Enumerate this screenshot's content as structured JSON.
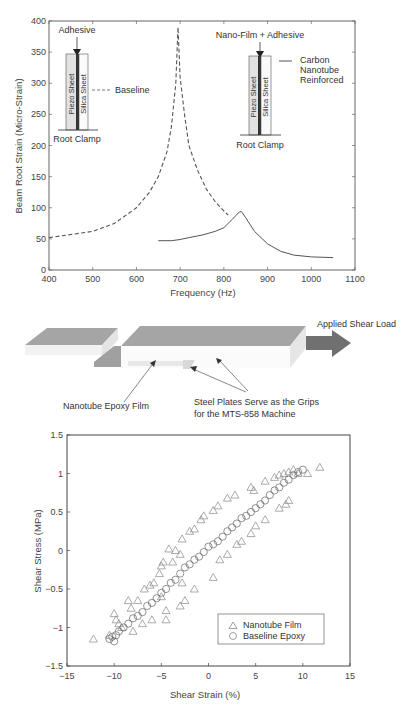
{
  "chart_data": [
    {
      "type": "line",
      "title": "",
      "xlabel": "Frequency (Hz)",
      "ylabel": "Beam Root Strain (Micro-Strain)",
      "xlim": [
        400,
        1100
      ],
      "ylim": [
        0,
        400
      ],
      "xticks": [
        400,
        500,
        600,
        700,
        800,
        900,
        1000,
        1100
      ],
      "yticks": [
        0,
        50,
        100,
        150,
        200,
        250,
        300,
        350,
        400
      ],
      "grid": false,
      "series": [
        {
          "name": "Baseline",
          "style": "dashed",
          "x": [
            400,
            450,
            500,
            550,
            600,
            630,
            650,
            670,
            680,
            690,
            695,
            700,
            710,
            720,
            740,
            760,
            780,
            800,
            810
          ],
          "y": [
            52,
            57,
            62,
            75,
            100,
            125,
            150,
            190,
            230,
            300,
            390,
            310,
            250,
            200,
            160,
            130,
            110,
            95,
            88
          ]
        },
        {
          "name": "Carbon Nanotube Reinforced",
          "style": "solid",
          "x": [
            650,
            680,
            700,
            720,
            750,
            780,
            800,
            820,
            835,
            840,
            850,
            870,
            900,
            930,
            960,
            1000,
            1050
          ],
          "y": [
            47,
            47,
            49,
            52,
            56,
            62,
            68,
            82,
            93,
            94,
            84,
            62,
            42,
            30,
            24,
            21,
            20
          ]
        }
      ],
      "annotations": [
        {
          "text": "Adhesive",
          "x": 460,
          "y": 385
        },
        {
          "text": "Baseline",
          "x": 560,
          "y": 300
        },
        {
          "text": "Root Clamp",
          "x": 460,
          "y": 215
        },
        {
          "text": "Nano-Film + Adhesive",
          "x": 880,
          "y": 380
        },
        {
          "text": "Carbon",
          "x": 930,
          "y": 340
        },
        {
          "text": "Nanotube",
          "x": 930,
          "y": 322
        },
        {
          "text": "Reinforced",
          "x": 930,
          "y": 305
        },
        {
          "text": "Root Clamp",
          "x": 880,
          "y": 200
        }
      ],
      "inset_labels": {
        "piezo": "Piezo Sheet",
        "silica": "Silica Sheet"
      }
    },
    {
      "type": "scatter",
      "title": "",
      "xlabel": "Shear Strain (%)",
      "ylabel": "Shear Stress (MPa)",
      "xlim": [
        -15,
        15
      ],
      "ylim": [
        -1.5,
        1.5
      ],
      "xticks": [
        -15,
        -10,
        -5,
        0,
        5,
        10,
        15
      ],
      "ytick_labels": [
        "1.5",
        "1",
        "0.5",
        "0",
        "−0.5",
        "−1",
        "−1.5"
      ],
      "xtick_labels": [
        "−15",
        "−10",
        "−5",
        "0",
        "5",
        "10",
        "15"
      ],
      "yticks": [
        1.5,
        1,
        0.5,
        0,
        -0.5,
        -1,
        -1.5
      ],
      "grid": false,
      "legend_position": "lower right",
      "series": [
        {
          "name": "Nanotube Film",
          "marker": "triangle",
          "x": [
            -12.2,
            -10.5,
            -10,
            -9.8,
            -9.2,
            -8.5,
            -8.2,
            -7.5,
            -6.8,
            -6.2,
            -5.8,
            -5.2,
            -5,
            -4.8,
            -4.2,
            -3.8,
            -3.5,
            -3,
            -2.8,
            -2,
            -1.5,
            -0.8,
            -0.5,
            0.5,
            1,
            2,
            2.8,
            4.5,
            4.8,
            6,
            7,
            7.5,
            8,
            8.5,
            9,
            9.5,
            10.5,
            11.8,
            -4.5,
            -3,
            -2.5,
            -1.5,
            0.5,
            1.2,
            2,
            3,
            3.5,
            4.5,
            5,
            6,
            7.5,
            8.2,
            8.5,
            -9.5,
            -8,
            -7,
            -6,
            -5,
            -4.5,
            -2.8
          ],
          "y": [
            -1.15,
            -1.1,
            -0.82,
            -0.9,
            -1.0,
            -0.65,
            -0.75,
            -0.65,
            -0.5,
            -0.45,
            -0.42,
            -0.3,
            -0.2,
            -0.15,
            0.02,
            -0.15,
            0.0,
            -0.05,
            0.15,
            0.25,
            0.28,
            0.4,
            0.45,
            0.52,
            0.58,
            0.68,
            0.72,
            0.82,
            0.78,
            0.9,
            0.95,
            0.98,
            1.0,
            1.02,
            1.05,
            1.0,
            1.0,
            1.08,
            -0.9,
            -0.72,
            -0.65,
            -0.5,
            -0.35,
            -0.12,
            -0.05,
            0.08,
            0.12,
            0.22,
            0.32,
            0.4,
            0.55,
            0.6,
            0.65,
            -0.95,
            -1.05,
            -0.95,
            -0.9,
            -0.6,
            -0.78,
            -0.42
          ]
        },
        {
          "name": "Baseline Epoxy",
          "marker": "circle",
          "x": [
            -10.5,
            -10.2,
            -10,
            -9.8,
            -9.5,
            -9,
            -8.5,
            -8,
            -7.5,
            -7,
            -6.5,
            -6,
            -5.5,
            -5,
            -4.5,
            -4,
            -3.5,
            -3,
            -2.5,
            -2,
            -1.5,
            -1,
            -0.5,
            0,
            0.5,
            1,
            1.5,
            2,
            2.5,
            3,
            3.5,
            4,
            4.5,
            5,
            5.5,
            6,
            6.5,
            7,
            7.5,
            8,
            8.5,
            9,
            9.5,
            10
          ],
          "y": [
            -1.15,
            -1.12,
            -1.18,
            -1.1,
            -1.05,
            -1.0,
            -0.95,
            -0.88,
            -0.85,
            -0.8,
            -0.72,
            -0.68,
            -0.62,
            -0.55,
            -0.5,
            -0.42,
            -0.38,
            -0.3,
            -0.22,
            -0.18,
            -0.12,
            -0.08,
            -0.02,
            0.05,
            0.08,
            0.12,
            0.18,
            0.25,
            0.3,
            0.35,
            0.42,
            0.45,
            0.5,
            0.55,
            0.6,
            0.65,
            0.72,
            0.78,
            0.82,
            0.88,
            0.92,
            0.98,
            1.02,
            1.05
          ]
        }
      ]
    }
  ],
  "diagram": {
    "applied_load_label": "Applied Shear Load",
    "film_label": "Nanotube Epoxy Film",
    "plates_label_line1": "Steel Plates Serve as the Grips",
    "plates_label_line2": "for the MTS-858 Machine"
  },
  "colors": {
    "axis": "#444444",
    "line": "#555555",
    "marker": "#777777",
    "plate": "#a0a0a0",
    "arrow": "#6e6e6e"
  }
}
